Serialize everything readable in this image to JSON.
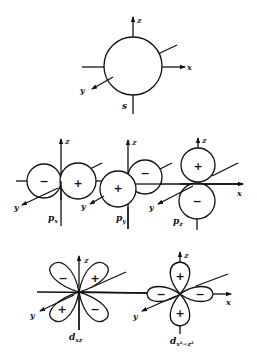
{
  "figure": {
    "line_color": "#111111",
    "background": "#ffffff"
  },
  "axes_labels": {
    "x": "x",
    "y": "y",
    "z": "z"
  },
  "orbitals": {
    "s": {
      "label": "s",
      "lobes": []
    },
    "px": {
      "label": "p",
      "subscript": "x",
      "lobes": [
        {
          "sign": "−"
        },
        {
          "sign": "+"
        }
      ]
    },
    "py": {
      "label": "p",
      "subscript": "y",
      "lobes": [
        {
          "sign": "+"
        },
        {
          "sign": "−"
        }
      ]
    },
    "pz": {
      "label": "p",
      "subscript": "z",
      "lobes": [
        {
          "sign": "+"
        },
        {
          "sign": "−"
        }
      ]
    },
    "dxz": {
      "label": "d",
      "subscript": "xz",
      "lobes": [
        {
          "sign": "−"
        },
        {
          "sign": "+"
        },
        {
          "sign": "+"
        },
        {
          "sign": "−"
        }
      ]
    },
    "dx2z2": {
      "label": "d",
      "subscript": "x²−z²",
      "lobes": [
        {
          "sign": "+"
        },
        {
          "sign": "−"
        },
        {
          "sign": "−"
        },
        {
          "sign": "+"
        }
      ]
    }
  }
}
